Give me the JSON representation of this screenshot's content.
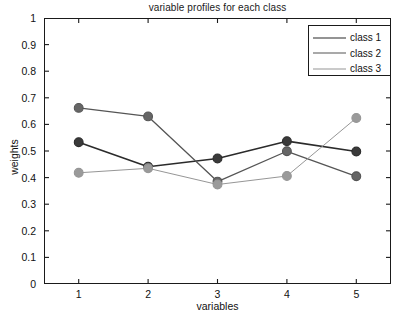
{
  "chart_data": {
    "type": "line",
    "title": "variable profiles for each class",
    "xlabel": "variables",
    "ylabel": "weights",
    "x": [
      1,
      2,
      3,
      4,
      5
    ],
    "categories": [
      "1",
      "2",
      "3",
      "4",
      "5"
    ],
    "xlim": [
      0.5,
      5.5
    ],
    "ylim": [
      0,
      1
    ],
    "xticks": [
      "1",
      "2",
      "3",
      "4",
      "5"
    ],
    "yticks": [
      "0",
      "0.1",
      "0.2",
      "0.3",
      "0.4",
      "0.5",
      "0.6",
      "0.7",
      "0.8",
      "0.9",
      "1"
    ],
    "grid": false,
    "legend_position": "top-right",
    "marker": "filled-circle",
    "series": [
      {
        "name": "class 1",
        "values": [
          0.533,
          0.441,
          0.472,
          0.537,
          0.498
        ],
        "color": "#2b2b2b",
        "marker_color": "#3a3a3a",
        "line_width": 1.6
      },
      {
        "name": "class 2",
        "values": [
          0.662,
          0.63,
          0.385,
          0.499,
          0.405
        ],
        "color": "#555555",
        "marker_color": "#666666",
        "line_width": 1.3
      },
      {
        "name": "class 3",
        "values": [
          0.418,
          0.435,
          0.374,
          0.406,
          0.624
        ],
        "color": "#969696",
        "marker_color": "#9a9a9a",
        "line_width": 1.0
      }
    ]
  },
  "axes": {
    "frame_color": "#1a1a1a"
  }
}
